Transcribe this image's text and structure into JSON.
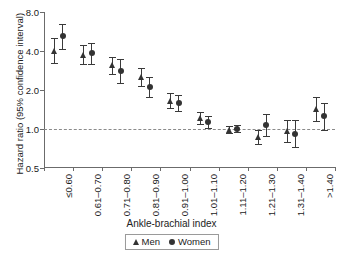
{
  "chart_data": {
    "type": "scatter",
    "title": "",
    "xlabel": "Ankle-brachial index",
    "ylabel": "Hazard ratio (95% confidence interval)",
    "yscale": "log",
    "ylim": [
      0.5,
      8.0
    ],
    "yticks": [
      0.5,
      1.0,
      2.0,
      4.0,
      8.0
    ],
    "ytick_labels": [
      "0.5",
      "1.0",
      "2.0",
      "4.0",
      "8.0"
    ],
    "grid": false,
    "reference_line": 1.0,
    "legend_position": "bottom-center",
    "categories": [
      "≤0.60",
      "0.61–0.70",
      "0.71–0.80",
      "0.81–0.90",
      "0.91–1.00",
      "1.01–1.10",
      "1.11–1.20",
      "1.21–1.30",
      "1.31–1.40",
      ">1.40"
    ],
    "series": [
      {
        "name": "Men",
        "marker": "triangle",
        "color": "#333333",
        "values": [
          4.0,
          3.75,
          3.1,
          2.5,
          1.65,
          1.22,
          0.99,
          0.86,
          0.97,
          1.42
        ],
        "ci_low": [
          3.25,
          3.15,
          2.65,
          2.15,
          1.45,
          1.1,
          0.93,
          0.76,
          0.8,
          1.15
        ],
        "ci_high": [
          5.0,
          4.45,
          3.6,
          2.95,
          1.9,
          1.36,
          1.05,
          0.98,
          1.18,
          1.78
        ]
      },
      {
        "name": "Women",
        "marker": "circle",
        "color": "#333333",
        "values": [
          5.2,
          3.85,
          2.8,
          2.1,
          1.58,
          1.13,
          1.0,
          1.07,
          0.92,
          1.25
        ],
        "ci_low": [
          4.15,
          3.2,
          2.25,
          1.78,
          1.38,
          1.02,
          0.94,
          0.88,
          0.73,
          0.98
        ],
        "ci_high": [
          6.5,
          4.6,
          3.45,
          2.5,
          1.82,
          1.26,
          1.07,
          1.3,
          1.17,
          1.6
        ]
      }
    ]
  },
  "legend": {
    "men_label": "Men",
    "women_label": "Women"
  }
}
